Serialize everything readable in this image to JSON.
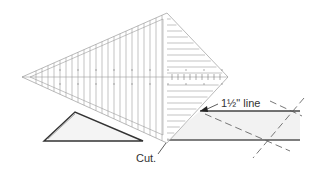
{
  "labels": {
    "line_label": "1½\" line",
    "cut_label": "Cut."
  },
  "colors": {
    "ruler_lines": "#9a9a9a",
    "outline": "#444444",
    "strip_fill": "#f2f2f2",
    "triangle_fill": "#f4f4f4"
  },
  "elements": {
    "ruler": "Triangle-shaped quilting ruler (kite shape) with grid lines",
    "fabric_strip": "Fabric strip with dashed cut guide lines",
    "cut_triangle": "Small triangle piece that has been cut"
  }
}
